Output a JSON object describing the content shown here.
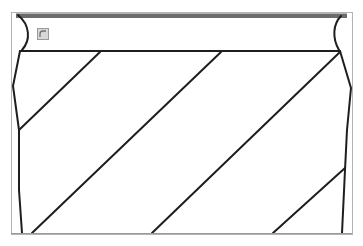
{
  "diagram": {
    "type": "hatched-section-drawing",
    "hatch_line_count": 4,
    "colors": {
      "ink": "#1e1e1e",
      "top_bar": "#6b6b6b",
      "frame": "#b4b4b4"
    },
    "icons": {
      "corner_icon": "resize-handle-icon"
    }
  }
}
